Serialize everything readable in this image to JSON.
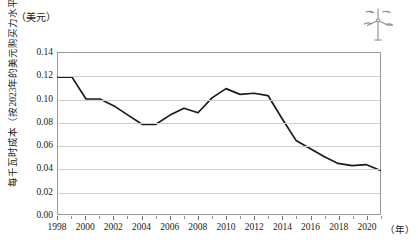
{
  "chart_data": {
    "type": "line",
    "title": "",
    "xlabel": "年",
    "ylabel": "每千瓦时成本（按2023年的美元购买力水平计算）",
    "y_unit": "（美元）",
    "x_unit": "（年）",
    "xlim": [
      1998,
      2021
    ],
    "ylim": [
      0.0,
      0.14
    ],
    "grid": true,
    "legend": null,
    "y_ticks": [
      "0.00",
      "0.02",
      "0.04",
      "0.06",
      "0.08",
      "0.10",
      "0.12",
      "0.14"
    ],
    "y_tick_values": [
      0.0,
      0.02,
      0.04,
      0.06,
      0.08,
      0.1,
      0.12,
      0.14
    ],
    "x_ticks": [
      "1998",
      "2000",
      "2002",
      "2004",
      "2006",
      "2008",
      "2010",
      "2012",
      "2014",
      "2016",
      "2018",
      "2020"
    ],
    "x_tick_values": [
      1998,
      2000,
      2002,
      2004,
      2006,
      2008,
      2010,
      2012,
      2014,
      2016,
      2018,
      2020
    ],
    "x": [
      1998,
      1999,
      2000,
      2001,
      2002,
      2003,
      2004,
      2005,
      2006,
      2007,
      2008,
      2009,
      2010,
      2011,
      2012,
      2013,
      2014,
      2015,
      2016,
      2017,
      2018,
      2019,
      2020,
      2021
    ],
    "values": [
      0.119,
      0.119,
      0.1,
      0.1,
      0.094,
      0.086,
      0.078,
      0.078,
      0.086,
      0.092,
      0.088,
      0.101,
      0.109,
      0.104,
      0.105,
      0.103,
      0.083,
      0.064,
      0.057,
      0.05,
      0.044,
      0.042,
      0.043,
      0.038
    ],
    "line_color": "#1a1a1a",
    "grid_color": "#cfcfcf",
    "axis_color": "#9a9a9a"
  },
  "decor": {
    "turbine_icon": "wind-turbine-icon"
  }
}
